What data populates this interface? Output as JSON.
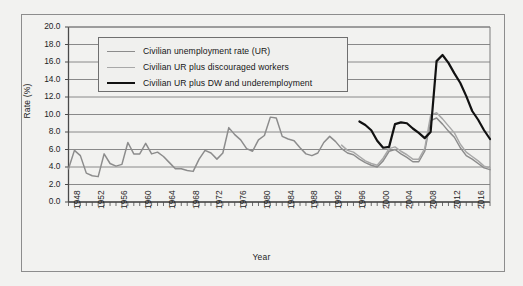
{
  "chart_data": {
    "type": "line",
    "title": "",
    "xlabel": "Year",
    "ylabel": "Rate (%)",
    "xlim": [
      1948,
      2019
    ],
    "ylim": [
      0.0,
      20.0
    ],
    "ytick_step": 2.0,
    "grid": "horizontal",
    "legend_position": "upper-left-inside",
    "ytick_labels": [
      "0.0",
      "2.0",
      "4.0",
      "6.0",
      "8.0",
      "10.0",
      "12.0",
      "14.0",
      "16.0",
      "18.0",
      "20.0"
    ],
    "xtick_labels": [
      "1948",
      "1952",
      "1956",
      "1960",
      "1964",
      "1968",
      "1972",
      "1976",
      "1980",
      "1984",
      "1988",
      "1992",
      "1996",
      "2000",
      "2004",
      "2008",
      "2012",
      "2016"
    ],
    "xtick_minor_interval": 1,
    "series": [
      {
        "name": "Civilian unemployment rate (UR)",
        "color": "#8c8c8c",
        "width": 1.5,
        "x": [
          1948,
          1949,
          1950,
          1951,
          1952,
          1953,
          1954,
          1955,
          1956,
          1957,
          1958,
          1959,
          1960,
          1961,
          1962,
          1963,
          1964,
          1965,
          1966,
          1967,
          1968,
          1969,
          1970,
          1971,
          1972,
          1973,
          1974,
          1975,
          1976,
          1977,
          1978,
          1979,
          1980,
          1981,
          1982,
          1983,
          1984,
          1985,
          1986,
          1987,
          1988,
          1989,
          1990,
          1991,
          1992,
          1993,
          1994,
          1995,
          1996,
          1997,
          1998,
          1999,
          2000,
          2001,
          2002,
          2003,
          2004,
          2005,
          2006,
          2007,
          2008,
          2009,
          2010,
          2011,
          2012,
          2013,
          2014,
          2015,
          2016,
          2017,
          2018,
          2019
        ],
        "values": [
          3.8,
          5.9,
          5.3,
          3.3,
          3.0,
          2.9,
          5.5,
          4.4,
          4.1,
          4.3,
          6.8,
          5.5,
          5.5,
          6.7,
          5.5,
          5.7,
          5.2,
          4.5,
          3.8,
          3.8,
          3.6,
          3.5,
          4.9,
          5.9,
          5.6,
          4.9,
          5.6,
          8.5,
          7.7,
          7.1,
          6.1,
          5.8,
          7.1,
          7.6,
          9.7,
          9.6,
          7.5,
          7.2,
          7.0,
          6.2,
          5.5,
          5.3,
          5.6,
          6.8,
          7.5,
          6.9,
          6.1,
          5.6,
          5.4,
          4.9,
          4.5,
          4.2,
          4.0,
          4.7,
          5.8,
          6.0,
          5.5,
          5.1,
          4.6,
          4.6,
          5.8,
          9.3,
          9.6,
          8.9,
          8.1,
          7.4,
          6.2,
          5.3,
          4.9,
          4.4,
          3.9,
          3.7
        ]
      },
      {
        "name": "Civilian UR plus discouraged workers",
        "color": "#a8a8a8",
        "width": 1.5,
        "x": [
          1994,
          1995,
          1996,
          1997,
          1998,
          1999,
          2000,
          2001,
          2002,
          2003,
          2004,
          2005,
          2006,
          2007,
          2008,
          2009,
          2010,
          2011,
          2012,
          2013,
          2014,
          2015,
          2016,
          2017,
          2018,
          2019
        ],
        "values": [
          6.5,
          5.9,
          5.7,
          5.2,
          4.7,
          4.4,
          4.2,
          5.0,
          6.1,
          6.3,
          5.8,
          5.4,
          4.9,
          4.9,
          6.1,
          9.9,
          10.2,
          9.5,
          8.7,
          7.9,
          6.6,
          5.7,
          5.2,
          4.7,
          4.1,
          3.9
        ]
      },
      {
        "name": "Civilian UR plus DW and underemployment",
        "color": "#111111",
        "width": 2.2,
        "x": [
          1997,
          1998,
          1999,
          2000,
          2001,
          2002,
          2003,
          2004,
          2005,
          2006,
          2007,
          2008,
          2009,
          2010,
          2011,
          2012,
          2013,
          2014,
          2015,
          2016,
          2017,
          2018,
          2019
        ],
        "values": [
          9.2,
          8.8,
          8.2,
          7.0,
          6.2,
          6.3,
          8.9,
          9.1,
          9.0,
          8.4,
          7.9,
          7.3,
          8.0,
          16.1,
          16.8,
          15.9,
          14.7,
          13.6,
          12.1,
          10.4,
          9.4,
          8.2,
          7.2
        ]
      }
    ]
  },
  "legend": {
    "items": [
      {
        "label": "Civilian unemployment rate (UR)"
      },
      {
        "label": "Civilian UR plus discouraged workers"
      },
      {
        "label": "Civilian UR plus DW and underemployment"
      }
    ]
  }
}
